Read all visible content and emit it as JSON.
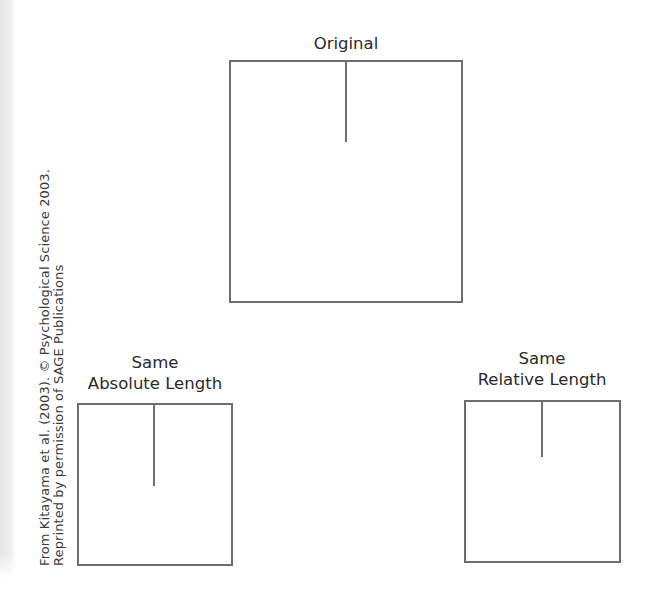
{
  "figure": {
    "panels": [
      {
        "id": "original",
        "label_lines": [
          "Original"
        ],
        "box": {
          "x": 229,
          "y": 60,
          "width": 234,
          "height": 243
        },
        "line": {
          "x_offset": 114,
          "length": 80
        }
      },
      {
        "id": "same-absolute-length",
        "label_lines": [
          "Same",
          "Absolute Length"
        ],
        "box": {
          "x": 77,
          "y": 403,
          "width": 156,
          "height": 163
        },
        "line": {
          "x_offset": 75,
          "length": 81
        }
      },
      {
        "id": "same-relative-length",
        "label_lines": [
          "Same",
          "Relative Length"
        ],
        "box": {
          "x": 464,
          "y": 400,
          "width": 157,
          "height": 163
        },
        "line": {
          "x_offset": 76,
          "length": 55
        }
      }
    ],
    "credit": {
      "line1": "From Kitayama et al. (2003). © Psychological Science 2003.",
      "line2": "Reprinted by permission of SAGE Publications"
    },
    "colors": {
      "stroke": "#6e6e6e",
      "text": "#2a2a2a",
      "background": "#ffffff"
    }
  }
}
